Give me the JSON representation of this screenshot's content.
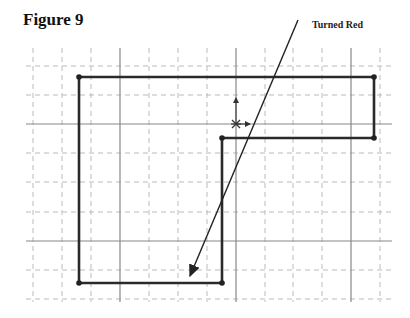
{
  "figure": {
    "title": "Figure 9",
    "callout_label": "Turned Red"
  },
  "grid": {
    "x_start": 26,
    "x_end": 392,
    "y_start": 48,
    "y_end": 302,
    "minor_x": [
      33,
      62,
      91,
      149,
      178,
      207,
      265,
      293,
      322,
      380
    ],
    "major_x": [
      120,
      236,
      351
    ],
    "minor_y": [
      66,
      95,
      153,
      182,
      212,
      270,
      299
    ],
    "major_y": [
      124,
      241
    ],
    "minor_color": "#bbbbbb",
    "major_color": "#888888"
  },
  "shape": {
    "points": [
      [
        79,
        77
      ],
      [
        374,
        77
      ],
      [
        374,
        138
      ],
      [
        222,
        138
      ],
      [
        222,
        283
      ],
      [
        79,
        283
      ]
    ],
    "stroke": "#2a2a2a"
  },
  "origin": {
    "x": 236,
    "y": 124
  },
  "arrow": {
    "from": [
      298,
      20
    ],
    "to": [
      190,
      276
    ]
  }
}
